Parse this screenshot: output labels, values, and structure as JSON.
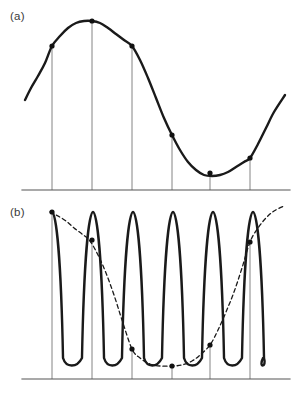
{
  "figure": {
    "title": "",
    "panels": [
      {
        "id": "a",
        "label": "(a)",
        "description": "Low-frequency sinusoid sampled at six instants"
      },
      {
        "id": "b",
        "label": "(b)",
        "description": "High-frequency sinusoid sampled at the same six instants, with dashed aliased reconstruction"
      }
    ]
  },
  "style": {
    "curve_color": "#1a1a1a",
    "dashed_color": "#1a1a1a",
    "axis_color": "#555555",
    "sample_line_color": "#777777",
    "marker_color": "#111111",
    "background": "#ffffff",
    "curve_width": 2.4,
    "dashed_width": 1.3,
    "axis_width": 1.2,
    "sample_line_width": 0.9,
    "marker_radius": 2.6,
    "dash_pattern": "4,3"
  },
  "chart_data": {
    "type": "line",
    "title": "",
    "xlabel": "",
    "ylabel": "",
    "grid": false,
    "legend": null,
    "xlim": [
      22,
      290
    ],
    "panels": [
      {
        "id": "a",
        "label": "(a)",
        "baseline_y": 190,
        "axis_x": [
          22,
          290
        ],
        "sample_x": [
          52,
          92,
          132,
          172,
          210,
          250
        ],
        "series": [
          {
            "name": "signal",
            "style": "solid",
            "x_start": 25,
            "x_end": 285,
            "points": [
              [
                25,
                100
              ],
              [
                31,
                88
              ],
              [
                38,
                76
              ],
              [
                45,
                63
              ],
              [
                52,
                46
              ],
              [
                60,
                36
              ],
              [
                68,
                28
              ],
              [
                76,
                23
              ],
              [
                84,
                21
              ],
              [
                92,
                21
              ],
              [
                100,
                23
              ],
              [
                108,
                28
              ],
              [
                116,
                34
              ],
              [
                124,
                40
              ],
              [
                132,
                46
              ],
              [
                140,
                60
              ],
              [
                148,
                78
              ],
              [
                156,
                98
              ],
              [
                164,
                118
              ],
              [
                172,
                135
              ],
              [
                180,
                150
              ],
              [
                188,
                162
              ],
              [
                196,
                170
              ],
              [
                204,
                175
              ],
              [
                212,
                176
              ],
              [
                220,
                175
              ],
              [
                228,
                172
              ],
              [
                236,
                167
              ],
              [
                244,
                162
              ],
              [
                250,
                158
              ],
              [
                258,
                144
              ],
              [
                266,
                128
              ],
              [
                274,
                112
              ],
              [
                285,
                95
              ]
            ]
          }
        ],
        "samples": [
          {
            "x": 52,
            "y": 46
          },
          {
            "x": 92,
            "y": 21
          },
          {
            "x": 132,
            "y": 46
          },
          {
            "x": 172,
            "y": 135
          },
          {
            "x": 210,
            "y": 173
          },
          {
            "x": 250,
            "y": 158
          }
        ]
      },
      {
        "id": "b",
        "label": "(b)",
        "baseline_y": 379,
        "axis_x": [
          22,
          290
        ],
        "sample_x": [
          52,
          92,
          132,
          172,
          210,
          250
        ],
        "series": [
          {
            "name": "high-frequency-signal",
            "style": "solid",
            "peak_y": 212,
            "trough_y": 368,
            "cycle_centers": [
              52,
              93,
              133,
              173,
              213,
              253
            ],
            "x_start": 50,
            "x_end": 263
          },
          {
            "name": "aliased-reconstruction",
            "style": "dashed",
            "points": [
              [
                50,
                212
              ],
              [
                58,
                216
              ],
              [
                66,
                221
              ],
              [
                74,
                228
              ],
              [
                82,
                234
              ],
              [
                90,
                241
              ],
              [
                98,
                255
              ],
              [
                106,
                273
              ],
              [
                114,
                295
              ],
              [
                122,
                320
              ],
              [
                132,
                349
              ],
              [
                140,
                358
              ],
              [
                150,
                364
              ],
              [
                160,
                366
              ],
              [
                172,
                366
              ],
              [
                182,
                365
              ],
              [
                192,
                361
              ],
              [
                200,
                355
              ],
              [
                210,
                345
              ],
              [
                218,
                330
              ],
              [
                226,
                312
              ],
              [
                234,
                292
              ],
              [
                242,
                268
              ],
              [
                250,
                242
              ],
              [
                258,
                228
              ],
              [
                266,
                218
              ],
              [
                274,
                211
              ],
              [
                284,
                206
              ]
            ]
          }
        ],
        "samples": [
          {
            "x": 52,
            "y": 212
          },
          {
            "x": 92,
            "y": 240
          },
          {
            "x": 132,
            "y": 349
          },
          {
            "x": 172,
            "y": 366
          },
          {
            "x": 210,
            "y": 345
          },
          {
            "x": 250,
            "y": 242
          }
        ]
      }
    ]
  }
}
